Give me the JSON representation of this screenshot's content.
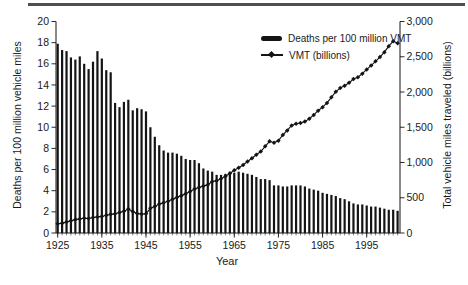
{
  "page": {
    "top_rule_color": "#4f4f4f",
    "background": "#ffffff"
  },
  "chart_data": {
    "type": "combo",
    "title": "",
    "categories": [
      1925,
      1926,
      1927,
      1928,
      1929,
      1930,
      1931,
      1932,
      1933,
      1934,
      1935,
      1936,
      1937,
      1938,
      1939,
      1940,
      1941,
      1942,
      1943,
      1944,
      1945,
      1946,
      1947,
      1948,
      1949,
      1950,
      1951,
      1952,
      1953,
      1954,
      1955,
      1956,
      1957,
      1958,
      1959,
      1960,
      1961,
      1962,
      1963,
      1964,
      1965,
      1966,
      1967,
      1968,
      1969,
      1970,
      1971,
      1972,
      1973,
      1974,
      1975,
      1976,
      1977,
      1978,
      1979,
      1980,
      1981,
      1982,
      1983,
      1984,
      1985,
      1986,
      1987,
      1988,
      1989,
      1990,
      1991,
      1992,
      1993,
      1994,
      1995,
      1996,
      1997,
      1998,
      1999,
      2000,
      2001,
      2002
    ],
    "series": [
      {
        "name": "Deaths per 100 million VMT",
        "type": "bar",
        "axis": "left",
        "color": "#141414",
        "values": [
          17.9,
          17.3,
          17.2,
          16.6,
          16.4,
          16.7,
          16.0,
          15.5,
          16.2,
          17.2,
          16.5,
          15.4,
          15.2,
          12.3,
          11.9,
          12.4,
          12.6,
          11.6,
          11.8,
          11.7,
          11.5,
          10.0,
          9.1,
          8.3,
          7.8,
          7.6,
          7.6,
          7.5,
          7.3,
          7.0,
          6.9,
          6.9,
          6.6,
          6.1,
          5.9,
          5.8,
          5.5,
          5.5,
          5.6,
          5.8,
          5.7,
          5.8,
          5.7,
          5.6,
          5.5,
          5.3,
          5.1,
          5.1,
          5.0,
          4.5,
          4.5,
          4.4,
          4.4,
          4.5,
          4.5,
          4.5,
          4.4,
          4.2,
          4.1,
          4.0,
          3.8,
          3.7,
          3.6,
          3.5,
          3.3,
          3.2,
          3.0,
          2.8,
          2.7,
          2.7,
          2.6,
          2.5,
          2.5,
          2.4,
          2.3,
          2.2,
          2.2,
          2.1
        ]
      },
      {
        "name": "VMT (billions)",
        "type": "line",
        "axis": "right",
        "color": "#141414",
        "marker": "diamond",
        "values": [
          130,
          140,
          155,
          172,
          190,
          200,
          210,
          205,
          220,
          228,
          235,
          252,
          265,
          272,
          290,
          310,
          340,
          305,
          275,
          270,
          272,
          350,
          375,
          410,
          430,
          450,
          480,
          505,
          530,
          555,
          590,
          625,
          645,
          665,
          685,
          730,
          740,
          770,
          805,
          845,
          890,
          925,
          965,
          1015,
          1060,
          1110,
          1155,
          1230,
          1300,
          1280,
          1310,
          1390,
          1455,
          1525,
          1550,
          1560,
          1580,
          1620,
          1675,
          1735,
          1785,
          1845,
          1925,
          2005,
          2055,
          2090,
          2130,
          2185,
          2210,
          2260,
          2320,
          2375,
          2435,
          2495,
          2565,
          2650,
          2720,
          2690
        ]
      }
    ],
    "x_axis": {
      "label": "Year",
      "tick_labels": [
        "1925",
        "1935",
        "1945",
        "1955",
        "1965",
        "1975",
        "1985",
        "1995"
      ],
      "minor_ticks_every_year": true
    },
    "left_axis": {
      "label": "Deaths per 100 million vehicle miles",
      "ylim": [
        0,
        20
      ],
      "ticks": [
        0,
        2,
        4,
        6,
        8,
        10,
        12,
        14,
        16,
        18,
        20
      ]
    },
    "right_axis": {
      "label": "Total vehicle miles traveled (billions)",
      "ylim": [
        0,
        3000
      ],
      "tick_values": [
        0,
        500,
        1000,
        1500,
        2000,
        2500,
        3000
      ],
      "tick_labels": [
        "0",
        "500",
        "1,000",
        "1,500",
        "2,000",
        "2,500",
        "3,000"
      ]
    },
    "legend": {
      "position": "inside-top-center"
    },
    "grid": false
  }
}
